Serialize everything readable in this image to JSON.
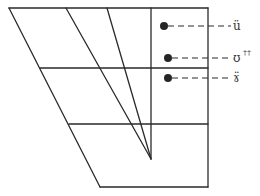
{
  "diagram": {
    "type": "vowel-quadrilateral",
    "colors": {
      "line": "#2a2a2a",
      "dot": "#262626",
      "label": "#333333",
      "background": "#ffffff"
    },
    "markers": [
      {
        "id": "marker-1",
        "symbol": "ü",
        "superscript": "",
        "x": 164,
        "y": 26
      },
      {
        "id": "marker-2",
        "symbol": "ʊ",
        "superscript": "††",
        "x": 168,
        "y": 58
      },
      {
        "id": "marker-3",
        "symbol": "ɤ̈",
        "superscript": "",
        "x": 168,
        "y": 78
      }
    ]
  }
}
